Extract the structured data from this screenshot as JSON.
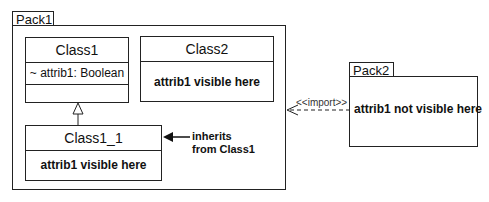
{
  "pack1": {
    "name": "Pack1",
    "class1": {
      "name": "Class1",
      "attribute": "~ attrib1: Boolean"
    },
    "class2": {
      "name": "Class2",
      "note": "attrib1 visible here"
    },
    "class1_1": {
      "name": "Class1_1",
      "note": "attrib1 visible here"
    },
    "annotation": {
      "line1": "inherits",
      "line2": "from Class1"
    }
  },
  "pack2": {
    "name": "Pack2",
    "note": "attrib1 not visible here"
  },
  "import_label": "<<import>>"
}
